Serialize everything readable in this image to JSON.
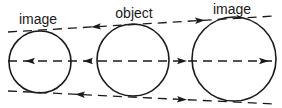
{
  "diagram": {
    "type": "optical-conjugate-spheres",
    "colors": {
      "stroke": "#1a1a1a",
      "background": "#ffffff"
    },
    "labels": [
      {
        "text": "image",
        "x": 38,
        "y": 12
      },
      {
        "text": "object",
        "x": 134,
        "y": 6
      },
      {
        "text": "image",
        "x": 232,
        "y": 2
      }
    ],
    "circles": [
      {
        "name": "left-image-circle",
        "cx": 40,
        "cy": 62,
        "r": 31
      },
      {
        "name": "object-circle",
        "cx": 133,
        "cy": 60,
        "r": 36
      },
      {
        "name": "right-image-circle",
        "cx": 234,
        "cy": 59,
        "r": 42
      }
    ],
    "lines": [
      {
        "name": "top-ray",
        "x1": 8,
        "y1": 32,
        "x2": 275,
        "y2": 16
      },
      {
        "name": "axis-ray",
        "x1": 8,
        "y1": 61,
        "x2": 275,
        "y2": 61
      },
      {
        "name": "bottom-ray",
        "x1": 8,
        "y1": 91,
        "x2": 275,
        "y2": 104
      }
    ],
    "arrows": [
      {
        "line": "top-ray",
        "x": 96,
        "direction": "left"
      },
      {
        "line": "top-ray",
        "x": 200,
        "direction": "right"
      },
      {
        "line": "axis-ray",
        "x": 30,
        "direction": "left"
      },
      {
        "line": "axis-ray",
        "x": 88,
        "direction": "left"
      },
      {
        "line": "axis-ray",
        "x": 182,
        "direction": "right"
      },
      {
        "line": "axis-ray",
        "x": 264,
        "direction": "right"
      },
      {
        "line": "bottom-ray",
        "x": 80,
        "direction": "left"
      },
      {
        "line": "bottom-ray",
        "x": 182,
        "direction": "right"
      }
    ]
  }
}
